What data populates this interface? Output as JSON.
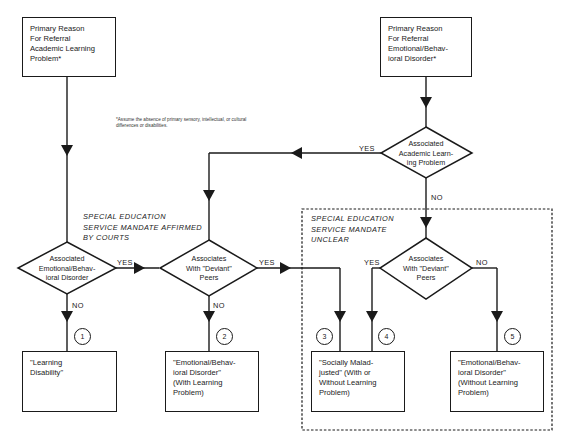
{
  "boxes": {
    "referral_academic": {
      "lines": [
        "Primary Reason",
        "For Referral",
        "Academic Learning",
        "Problem*"
      ]
    },
    "referral_emotional": {
      "lines": [
        "Primary Reason",
        "For Referral",
        "Emotional/Behav-",
        "ioral Disorder*"
      ]
    },
    "outcome_1": {
      "lines": [
        "\"Learning",
        "Disability\""
      ]
    },
    "outcome_2": {
      "lines": [
        "\"Emotional/Behav-",
        "ioral Disorder\"",
        "(With Learning",
        "Problem)"
      ]
    },
    "outcome_3_4": {
      "lines": [
        "\"Socially Malad-",
        "justed\" (With or",
        "Without Learning",
        "Problem)"
      ]
    },
    "outcome_5": {
      "lines": [
        "\"Emotional/Behav-",
        "ioral Disorder\"",
        "(Without Learning",
        "Problem)"
      ]
    }
  },
  "decisions": {
    "assoc_academic": {
      "lines": [
        "Associated",
        "Academic Learn-",
        "ing Problem"
      ]
    },
    "assoc_emotional": {
      "lines": [
        "Associated",
        "Emotional/Behav-",
        "ioral Disorder"
      ]
    },
    "deviant_peers_left": {
      "lines": [
        "Associates",
        "With \"Deviant\"",
        "Peers"
      ]
    },
    "deviant_peers_right": {
      "lines": [
        "Associates",
        "With \"Deviant\"",
        "Peers"
      ]
    }
  },
  "edge_labels": {
    "yes": "YES",
    "no": "NO"
  },
  "circles": [
    "1",
    "2",
    "3",
    "4",
    "5"
  ],
  "regions": {
    "affirmed": {
      "lines": [
        "SPECIAL EDUCATION",
        "SERVICE MANDATE AFFIRMED",
        "BY COURTS"
      ]
    },
    "unclear": {
      "lines": [
        "SPECIAL EDUCATION",
        "SERVICE MANDATE",
        "UNCLEAR"
      ]
    }
  },
  "footnote": {
    "lines": [
      "*Assume the absence of primary sensory, intellectual, or cultural",
      "differences or disabilities."
    ]
  },
  "colors": {
    "ink": "#1a1a1a",
    "background": "#ffffff"
  }
}
